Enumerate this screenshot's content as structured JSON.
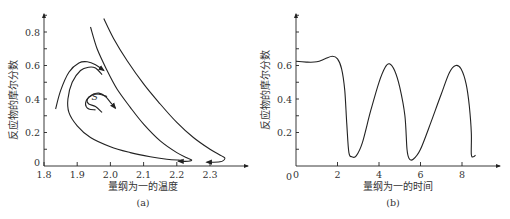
{
  "chart_data": [
    {
      "type": "line",
      "panel_label": "(a)",
      "title": "",
      "xlabel": "量纲为一的温度",
      "ylabel": "反应物的摩尔分数",
      "xlim": [
        1.8,
        2.4
      ],
      "ylim": [
        0,
        0.9
      ],
      "xticks": [
        1.8,
        1.9,
        2.0,
        2.1,
        2.2,
        2.3
      ],
      "xtick_labels": [
        "1.8",
        "1.9",
        "2.0",
        "2.1",
        "2.2",
        "2.3"
      ],
      "yticks": [
        0,
        0.2,
        0.4,
        0.6,
        0.8
      ],
      "ytick_labels": [
        "0",
        "0.2",
        "0.4",
        "0.6",
        "0.8"
      ],
      "annotations": [
        {
          "text": "S",
          "x": 1.955,
          "y": 0.41
        }
      ],
      "grid": false,
      "series": [
        {
          "name": "trajectory-1",
          "arrow": "end",
          "points": [
            [
              1.835,
              0.34
            ],
            [
              1.85,
              0.45
            ],
            [
              1.875,
              0.56
            ],
            [
              1.905,
              0.615
            ],
            [
              1.93,
              0.622
            ],
            [
              1.955,
              0.605
            ],
            [
              1.98,
              0.57
            ]
          ]
        },
        {
          "name": "trajectory-2",
          "arrow": "end",
          "points": [
            [
              1.975,
              0.32
            ],
            [
              1.955,
              0.355
            ],
            [
              1.935,
              0.37
            ],
            [
              1.93,
              0.395
            ],
            [
              1.945,
              0.425
            ],
            [
              1.965,
              0.435
            ],
            [
              1.985,
              0.415
            ],
            [
              2.0,
              0.38
            ],
            [
              2.015,
              0.345
            ]
          ]
        },
        {
          "name": "spiral-S",
          "arrow": "none",
          "points": [
            [
              1.955,
              0.335
            ],
            [
              1.935,
              0.34
            ],
            [
              1.925,
              0.37
            ],
            [
              1.935,
              0.41
            ],
            [
              1.96,
              0.43
            ],
            [
              1.99,
              0.415
            ]
          ]
        },
        {
          "name": "trajectory-3",
          "arrow": "end",
          "points": [
            [
              1.94,
              0.83
            ],
            [
              1.96,
              0.7
            ],
            [
              1.99,
              0.57
            ],
            [
              2.02,
              0.46
            ],
            [
              2.06,
              0.35
            ],
            [
              2.1,
              0.25
            ],
            [
              2.15,
              0.15
            ],
            [
              2.2,
              0.08
            ],
            [
              2.235,
              0.045
            ],
            [
              2.245,
              0.035
            ],
            [
              2.235,
              0.028
            ],
            [
              2.205,
              0.028
            ]
          ]
        },
        {
          "name": "trajectory-4",
          "arrow": "end",
          "points": [
            [
              1.98,
              0.88
            ],
            [
              2.01,
              0.76
            ],
            [
              2.05,
              0.63
            ],
            [
              2.1,
              0.49
            ],
            [
              2.15,
              0.37
            ],
            [
              2.2,
              0.26
            ],
            [
              2.25,
              0.17
            ],
            [
              2.3,
              0.1
            ],
            [
              2.335,
              0.06
            ],
            [
              2.345,
              0.045
            ],
            [
              2.33,
              0.025
            ],
            [
              2.29,
              0.022
            ]
          ]
        },
        {
          "name": "trajectory-5",
          "arrow": "none",
          "points": [
            [
              1.975,
              0.545
            ],
            [
              1.955,
              0.585
            ],
            [
              1.935,
              0.59
            ],
            [
              1.91,
              0.57
            ],
            [
              1.885,
              0.5
            ],
            [
              1.872,
              0.4
            ],
            [
              1.875,
              0.32
            ],
            [
              1.9,
              0.24
            ],
            [
              1.94,
              0.17
            ],
            [
              2.0,
              0.115
            ],
            [
              2.06,
              0.08
            ],
            [
              2.12,
              0.055
            ],
            [
              2.17,
              0.04
            ],
            [
              2.205,
              0.035
            ],
            [
              2.215,
              0.035
            ]
          ]
        }
      ]
    },
    {
      "type": "line",
      "panel_label": "(b)",
      "title": "",
      "xlabel": "量纲为一的时间",
      "ylabel": "反应物的摩尔分数",
      "xlim": [
        0,
        9.5
      ],
      "ylim": [
        0,
        0.9
      ],
      "xticks": [
        0,
        2,
        4,
        6,
        8
      ],
      "xtick_labels": [
        "0",
        "2",
        "4",
        "6",
        "8"
      ],
      "yticks": [
        0.2,
        0.4,
        0.6
      ],
      "ytick_labels": [
        "0.2",
        "0.4",
        "0.6"
      ],
      "grid": false,
      "series": [
        {
          "name": "concentration-vs-time",
          "points": [
            [
              0,
              0.625
            ],
            [
              0.5,
              0.62
            ],
            [
              1.0,
              0.622
            ],
            [
              1.4,
              0.64
            ],
            [
              1.75,
              0.655
            ],
            [
              2.0,
              0.64
            ],
            [
              2.2,
              0.58
            ],
            [
              2.35,
              0.45
            ],
            [
              2.45,
              0.25
            ],
            [
              2.55,
              0.08
            ],
            [
              2.7,
              0.055
            ],
            [
              2.9,
              0.06
            ],
            [
              3.2,
              0.14
            ],
            [
              3.6,
              0.33
            ],
            [
              4.0,
              0.5
            ],
            [
              4.3,
              0.59
            ],
            [
              4.5,
              0.61
            ],
            [
              4.75,
              0.57
            ],
            [
              5.0,
              0.47
            ],
            [
              5.25,
              0.3
            ],
            [
              5.35,
              0.1
            ],
            [
              5.45,
              0.045
            ],
            [
              5.65,
              0.04
            ],
            [
              6.0,
              0.1
            ],
            [
              6.5,
              0.26
            ],
            [
              7.0,
              0.43
            ],
            [
              7.4,
              0.56
            ],
            [
              7.7,
              0.6
            ],
            [
              7.95,
              0.58
            ],
            [
              8.2,
              0.49
            ],
            [
              8.35,
              0.36
            ],
            [
              8.45,
              0.2
            ],
            [
              8.45,
              0.07
            ],
            [
              8.55,
              0.055
            ],
            [
              8.65,
              0.065
            ]
          ]
        }
      ]
    }
  ]
}
